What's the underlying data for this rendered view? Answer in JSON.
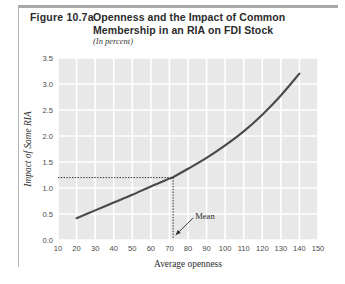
{
  "figure": {
    "number": "Figure 10.7a",
    "title": "Openness and the Impact of Common Membership in an RIA on FDI Stock",
    "subtitle": "(In percent)"
  },
  "colors": {
    "plot_background": "#e8e8e8",
    "gridline": "#ffffff",
    "curve": "#4a4a4a",
    "rule": "#a8a8a8",
    "tick_label": "#4a4a4a",
    "axis_title": "#2e2e2e"
  },
  "chart_data": {
    "type": "line",
    "title": "Openness and the Impact of Common Membership in an RIA on FDI Stock",
    "subtitle": "(In percent)",
    "xlabel": "Average openness",
    "ylabel": "Impact of Same RIA",
    "xlim": [
      10,
      150
    ],
    "ylim": [
      0.0,
      3.5
    ],
    "xticks": [
      10,
      20,
      30,
      40,
      50,
      60,
      70,
      80,
      90,
      100,
      110,
      120,
      130,
      140,
      150
    ],
    "yticks": [
      "0.0",
      "0.5",
      "1.0",
      "1.5",
      "2.0",
      "2.5",
      "3.0",
      "3.5"
    ],
    "grid": true,
    "legend": "none",
    "series": [
      {
        "name": "Impact of Same RIA",
        "x": [
          20,
          30,
          40,
          50,
          60,
          70,
          72,
          80,
          90,
          100,
          110,
          120,
          130,
          140
        ],
        "values": [
          0.42,
          0.57,
          0.72,
          0.87,
          1.03,
          1.18,
          1.21,
          1.37,
          1.58,
          1.82,
          2.09,
          2.41,
          2.78,
          3.2
        ]
      }
    ],
    "annotations": [
      {
        "label": "Mean",
        "x": 72,
        "y": 1.2,
        "type": "arrow-annotation",
        "guide_lines": [
          "horizontal-dotted-at-y-1.2",
          "vertical-dotted-at-x-72"
        ]
      }
    ]
  }
}
